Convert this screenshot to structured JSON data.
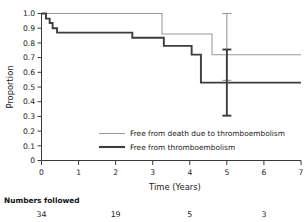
{
  "chart_data": {
    "type": "line",
    "title": "",
    "xlabel": "Time (Years)",
    "ylabel": "Proportion",
    "xlim": [
      0,
      7
    ],
    "ylim": [
      0,
      1.0
    ],
    "xticks": [
      "0",
      "1",
      "2",
      "3",
      "4",
      "5",
      "6",
      "7"
    ],
    "yticks": [
      "0",
      "0.1",
      "0.2",
      "0.3",
      "0.4",
      "0.5",
      "0.6",
      "0.7",
      "0.8",
      "0.9",
      "1.0"
    ],
    "grid": false,
    "legend_position": "lower center",
    "series": [
      {
        "name": "Free from death due to thromboembolism",
        "color": "#999999",
        "style": "step",
        "width": "thin",
        "points": [
          {
            "x": 0.0,
            "y": 1.0
          },
          {
            "x": 3.25,
            "y": 1.0
          },
          {
            "x": 3.25,
            "y": 0.86
          },
          {
            "x": 4.6,
            "y": 0.86
          },
          {
            "x": 4.6,
            "y": 0.72
          },
          {
            "x": 7.0,
            "y": 0.72
          }
        ]
      },
      {
        "name": "Free from thromboembolism",
        "color": "#3d3d3d",
        "style": "step",
        "width": "thick",
        "points": [
          {
            "x": 0.0,
            "y": 1.0
          },
          {
            "x": 0.12,
            "y": 1.0
          },
          {
            "x": 0.12,
            "y": 0.965
          },
          {
            "x": 0.22,
            "y": 0.965
          },
          {
            "x": 0.22,
            "y": 0.935
          },
          {
            "x": 0.3,
            "y": 0.935
          },
          {
            "x": 0.3,
            "y": 0.9
          },
          {
            "x": 0.42,
            "y": 0.9
          },
          {
            "x": 0.42,
            "y": 0.87
          },
          {
            "x": 2.45,
            "y": 0.87
          },
          {
            "x": 2.45,
            "y": 0.835
          },
          {
            "x": 3.3,
            "y": 0.835
          },
          {
            "x": 3.3,
            "y": 0.78
          },
          {
            "x": 4.05,
            "y": 0.78
          },
          {
            "x": 4.05,
            "y": 0.72
          },
          {
            "x": 4.3,
            "y": 0.72
          },
          {
            "x": 4.3,
            "y": 0.53
          },
          {
            "x": 7.0,
            "y": 0.53
          }
        ]
      }
    ],
    "error_bars": [
      {
        "series": "Free from death due to thromboembolism",
        "x": 5.0,
        "y": 0.72,
        "low": 0.545,
        "high": 1.0,
        "color": "#9a9a9a"
      },
      {
        "series": "Free from thromboembolism",
        "x": 5.0,
        "y": 0.53,
        "low": 0.305,
        "high": 0.755,
        "color": "#3d3d3d"
      }
    ],
    "legend": [
      {
        "label": "Free from death due to thromboembolism",
        "color": "#999999",
        "width": "thin"
      },
      {
        "label": "Free from thromboembolism",
        "color": "#3d3d3d",
        "width": "thick"
      }
    ],
    "risk_table": {
      "title": "Numbers followed",
      "x_positions": [
        0,
        2,
        4,
        6
      ],
      "values": [
        "34",
        "19",
        "5",
        "3"
      ]
    }
  }
}
